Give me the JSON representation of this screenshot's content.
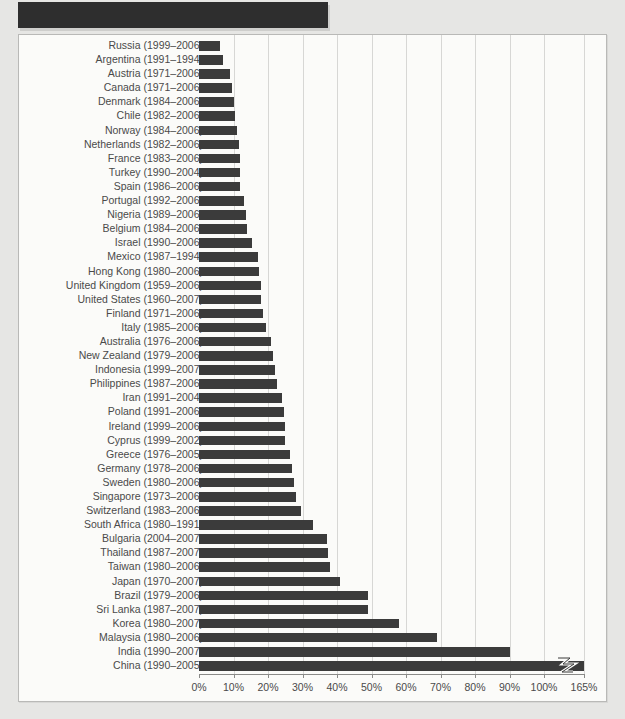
{
  "figure": {
    "redacted_header_label": "",
    "axis": {
      "xlabel": "",
      "ylabel": "",
      "tick_labels": [
        "0%",
        "10%",
        "20%",
        "30%",
        "40%",
        "50%",
        "60%",
        "70%",
        "80%",
        "90%",
        "100%",
        "165%"
      ],
      "tick_values": [
        0,
        10,
        20,
        30,
        40,
        50,
        60,
        70,
        80,
        90,
        100,
        165
      ],
      "axis_break": true,
      "break_after": "100%"
    },
    "colors": {
      "bar": "#3b3b3b",
      "page_background": "#e6e6e4",
      "plot_background": "#fbfbf9",
      "gridline": "#d7d7d5",
      "label_text": "#4a4a4a",
      "frame_border": "#b9b9b7",
      "redacted_header": "#2e2e2e"
    },
    "break_icon_name": "axis-break-zigzag-icon"
  },
  "chart_data": {
    "type": "bar",
    "orientation": "horizontal",
    "title": "",
    "xlabel": "",
    "ylabel": "",
    "xlim": [
      0,
      165
    ],
    "grid": true,
    "legend": "none",
    "xticks": [
      0,
      10,
      20,
      30,
      40,
      50,
      60,
      70,
      80,
      90,
      100,
      165
    ],
    "xticklabels": [
      "0%",
      "10%",
      "20%",
      "30%",
      "40%",
      "50%",
      "60%",
      "70%",
      "80%",
      "90%",
      "100%",
      "165%"
    ],
    "categories": [
      "Russia (1999–2006)",
      "Argentina (1991–1994)",
      "Austria (1971–2006)",
      "Canada (1971–2006)",
      "Denmark (1984–2006)",
      "Chile (1982–2006)",
      "Norway (1984–2006)",
      "Netherlands (1982–2006)",
      "France (1983–2006)",
      "Turkey (1990–2004)",
      "Spain (1986–2006)",
      "Portugal (1992–2006)",
      "Nigeria (1989–2006)",
      "Belgium (1984–2006)",
      "Israel (1990–2006)",
      "Mexico (1987–1994)",
      "Hong Kong (1980–2006)",
      "United Kingdom (1959–2006)",
      "United States (1960–2007)",
      "Finland (1971–2006)",
      "Italy (1985–2006)",
      "Australia (1976–2006)",
      "New Zealand (1979–2006)",
      "Indonesia (1999–2007)",
      "Philippines (1987–2006)",
      "Iran (1991–2004)",
      "Poland (1991–2006)",
      "Ireland (1999–2006)",
      "Cyprus (1999–2002)",
      "Greece (1976–2005)",
      "Germany (1978–2006)",
      "Sweden (1980–2006)",
      "Singapore (1973–2006)",
      "Switzerland (1983–2006)",
      "South Africa (1980–1991)",
      "Bulgaria (2004–2007)",
      "Thailand (1987–2007)",
      "Taiwan (1980–2006)",
      "Japan (1970–2007)",
      "Brazil (1979–2006)",
      "Sri Lanka (1987–2007)",
      "Korea (1980–2007)",
      "Malaysia (1980–2006)",
      "India (1990–2007)",
      "China (1990–2005)"
    ],
    "countries": [
      "Russia",
      "Argentina",
      "Austria",
      "Canada",
      "Denmark",
      "Chile",
      "Norway",
      "Netherlands",
      "France",
      "Turkey",
      "Spain",
      "Portugal",
      "Nigeria",
      "Belgium",
      "Israel",
      "Mexico",
      "Hong Kong",
      "United Kingdom",
      "United States",
      "Finland",
      "Italy",
      "Australia",
      "New Zealand",
      "Indonesia",
      "Philippines",
      "Iran",
      "Poland",
      "Ireland",
      "Cyprus",
      "Greece",
      "Germany",
      "Sweden",
      "Singapore",
      "Switzerland",
      "South Africa",
      "Bulgaria",
      "Thailand",
      "Taiwan",
      "Japan",
      "Brazil",
      "Sri Lanka",
      "Korea",
      "Malaysia",
      "India",
      "China"
    ],
    "periods": [
      "1999–2006",
      "1991–1994",
      "1971–2006",
      "1971–2006",
      "1984–2006",
      "1982–2006",
      "1984–2006",
      "1982–2006",
      "1983–2006",
      "1990–2004",
      "1986–2006",
      "1992–2006",
      "1989–2006",
      "1984–2006",
      "1990–2006",
      "1987–1994",
      "1980–2006",
      "1959–2006",
      "1960–2007",
      "1971–2006",
      "1985–2006",
      "1976–2006",
      "1979–2006",
      "1999–2007",
      "1987–2006",
      "1991–2004",
      "1991–2006",
      "1999–2006",
      "1999–2002",
      "1976–2005",
      "1978–2006",
      "1980–2006",
      "1973–2006",
      "1983–2006",
      "1980–1991",
      "2004–2007",
      "1987–2007",
      "1980–2006",
      "1970–2007",
      "1979–2006",
      "1987–2007",
      "1980–2007",
      "1980–2006",
      "1990–2007",
      "1990–2005"
    ],
    "values": [
      6,
      7,
      9,
      9.5,
      10,
      10.5,
      11,
      11.5,
      12,
      12,
      12,
      13,
      13.5,
      14,
      15.5,
      17,
      17.5,
      18,
      18,
      18.5,
      19.5,
      21,
      21.5,
      22,
      22.5,
      24,
      24.5,
      25,
      25,
      26.5,
      27,
      27.5,
      28,
      29.5,
      33,
      37,
      37.5,
      38,
      41,
      49,
      49,
      58,
      69,
      90,
      165
    ],
    "units": "percent"
  }
}
